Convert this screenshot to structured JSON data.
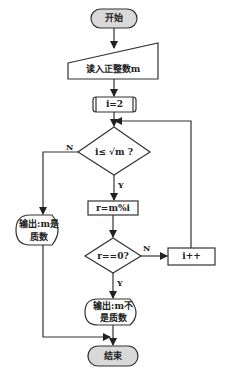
{
  "flowchart": {
    "nodes": {
      "start": {
        "label": "开始",
        "shape": "terminator"
      },
      "input": {
        "label": "读入正整数m",
        "shape": "manual-input"
      },
      "init": {
        "label": "i=2",
        "shape": "process"
      },
      "cond1": {
        "label": "i≤ √m ?",
        "shape": "decision"
      },
      "mod": {
        "label": "r=m%i",
        "shape": "process"
      },
      "cond2": {
        "label": "r==0?",
        "shape": "decision"
      },
      "inc": {
        "label": "i++",
        "shape": "process"
      },
      "out_prime_1": {
        "label": "输出:m是",
        "shape": "display"
      },
      "out_prime_2": {
        "label": "质数",
        "shape": "display"
      },
      "out_not_1": {
        "label": "输出:m不",
        "shape": "display"
      },
      "out_not_2": {
        "label": "是质数",
        "shape": "display"
      },
      "end": {
        "label": "结束",
        "shape": "terminator"
      }
    },
    "edge_labels": {
      "cond1_no": "N",
      "cond1_yes": "Y",
      "cond2_no": "N",
      "cond2_yes": "Y"
    },
    "colors": {
      "stroke": "#333333",
      "terminator_fill": "#d9d9d9",
      "fill": "#ffffff"
    }
  }
}
